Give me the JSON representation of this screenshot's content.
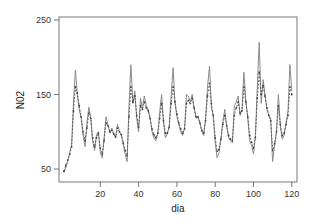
{
  "chart_data": {
    "type": "line",
    "title": "",
    "xlabel": "dia",
    "ylabel": "N02",
    "xlim": [
      0,
      122
    ],
    "ylim": [
      40,
      255
    ],
    "xticks": [
      20,
      40,
      60,
      80,
      100,
      120
    ],
    "yticks": [
      50,
      150,
      250
    ],
    "grid": false,
    "legend": null,
    "x": [
      1,
      2,
      3,
      4,
      5,
      6,
      7,
      8,
      9,
      10,
      11,
      12,
      13,
      14,
      15,
      16,
      17,
      18,
      19,
      20,
      21,
      22,
      23,
      24,
      25,
      26,
      27,
      28,
      29,
      30,
      31,
      32,
      33,
      34,
      35,
      36,
      37,
      38,
      39,
      40,
      41,
      42,
      43,
      44,
      45,
      46,
      47,
      48,
      49,
      50,
      51,
      52,
      53,
      54,
      55,
      56,
      57,
      58,
      59,
      60,
      61,
      62,
      63,
      64,
      65,
      66,
      67,
      68,
      69,
      70,
      71,
      72,
      73,
      74,
      75,
      76,
      77,
      78,
      79,
      80,
      81,
      82,
      83,
      84,
      85,
      86,
      87,
      88,
      89,
      90,
      91,
      92,
      93,
      94,
      95,
      96,
      97,
      98,
      99,
      100,
      101,
      102,
      103,
      104,
      105,
      106,
      107,
      108,
      109,
      110,
      111,
      112,
      113,
      114,
      115,
      116,
      117,
      118,
      119,
      120
    ],
    "series": [
      {
        "name": "observed",
        "style": "solid",
        "color": "#8a8a8a",
        "values": [
          45,
          52,
          60,
          72,
          82,
          140,
          183,
          150,
          130,
          118,
          95,
          80,
          110,
          133,
          120,
          88,
          75,
          96,
          100,
          72,
          65,
          92,
          120,
          110,
          98,
          105,
          98,
          92,
          110,
          100,
          95,
          82,
          70,
          60,
          135,
          190,
          138,
          155,
          118,
          100,
          145,
          132,
          148,
          135,
          130,
          118,
          100,
          92,
          88,
          98,
          126,
          150,
          113,
          92,
          97,
          107,
          150,
          186,
          138,
          120,
          110,
          100,
          95,
          105,
          150,
          148,
          140,
          150,
          132,
          118,
          120,
          112,
          100,
          95,
          118,
          160,
          188,
          132,
          120,
          85,
          65,
          72,
          90,
          115,
          130,
          108,
          92,
          88,
          85,
          135,
          140,
          148,
          122,
          130,
          180,
          142,
          118,
          88,
          82,
          70,
          95,
          160,
          220,
          138,
          170,
          150,
          130,
          122,
          118,
          60,
          82,
          100,
          150,
          108,
          90,
          95,
          112,
          128,
          190,
          155
        ]
      },
      {
        "name": "fitted",
        "style": "dashed-dots",
        "color": "#555555",
        "values": [
          47,
          55,
          62,
          70,
          80,
          128,
          160,
          152,
          135,
          120,
          100,
          88,
          105,
          125,
          118,
          92,
          80,
          92,
          98,
          78,
          70,
          88,
          112,
          108,
          100,
          102,
          97,
          93,
          105,
          100,
          96,
          85,
          75,
          68,
          120,
          160,
          140,
          148,
          122,
          106,
          135,
          130,
          140,
          132,
          128,
          118,
          104,
          96,
          92,
          98,
          118,
          138,
          115,
          98,
          98,
          106,
          138,
          160,
          140,
          124,
          112,
          104,
          98,
          104,
          138,
          142,
          138,
          145,
          132,
          120,
          120,
          112,
          102,
          98,
          115,
          148,
          165,
          138,
          122,
          92,
          74,
          76,
          90,
          110,
          122,
          108,
          95,
          90,
          88,
          122,
          132,
          140,
          125,
          128,
          160,
          140,
          120,
          95,
          86,
          78,
          92,
          145,
          180,
          150,
          162,
          148,
          132,
          122,
          115,
          75,
          84,
          100,
          135,
          110,
          95,
          98,
          110,
          122,
          160,
          150
        ]
      }
    ]
  },
  "axes": {
    "y_tick_labels": [
      "50",
      "150",
      "250"
    ],
    "x_tick_labels": [
      "20",
      "40",
      "60",
      "80",
      "100",
      "120"
    ],
    "xlabel": "dia",
    "ylabel": "N02"
  }
}
